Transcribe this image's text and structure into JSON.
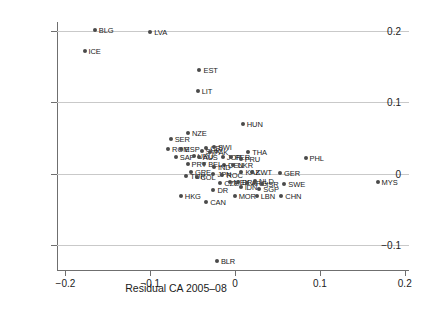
{
  "chart_data": {
    "type": "scatter",
    "title": "",
    "xlabel": "Residual CA 2005–08",
    "ylabel": "Change in CA balance, 2010 vs 2005–08",
    "xlim": [
      -0.21,
      0.205
    ],
    "ylim": [
      -0.135,
      0.212
    ],
    "xticks": [
      -0.2,
      -0.1,
      0,
      0.1,
      0.2
    ],
    "xticklabels": [
      "−0.2",
      "−0.1",
      "0",
      "0.1",
      "0.2"
    ],
    "yticks": [
      0.2,
      0.1,
      0,
      -0.1
    ],
    "yticklabels": [
      "0.2",
      "0.1",
      "0",
      "−0.1"
    ],
    "grid": "horizontal",
    "legend": "none",
    "marker_color": "#4a4a4a",
    "grid_color": "#c9c9c9",
    "axis_color": "#6f6f6f",
    "points": [
      {
        "label": "BLG",
        "x": -0.1655,
        "y": 0.2005
      },
      {
        "label": "LVA",
        "x": -0.1,
        "y": 0.1985
      },
      {
        "label": "ICE",
        "x": -0.1775,
        "y": 0.172
      },
      {
        "label": "EST",
        "x": -0.042,
        "y": 0.145
      },
      {
        "label": "LIT",
        "x": -0.044,
        "y": 0.1155
      },
      {
        "label": "HUN",
        "x": 0.009,
        "y": 0.069
      },
      {
        "label": "NZE",
        "x": -0.0555,
        "y": 0.0565
      },
      {
        "label": "SER",
        "x": -0.076,
        "y": 0.048
      },
      {
        "label": "ROM",
        "x": -0.079,
        "y": 0.0345
      },
      {
        "label": "ESP",
        "x": -0.064,
        "y": 0.0345
      },
      {
        "label": "CRI",
        "x": -0.034,
        "y": 0.036
      },
      {
        "label": "SWI",
        "x": -0.025,
        "y": 0.0375
      },
      {
        "label": "SVK",
        "x": -0.0395,
        "y": 0.031
      },
      {
        "label": "PAK",
        "x": -0.0295,
        "y": 0.0305
      },
      {
        "label": "THA",
        "x": 0.0155,
        "y": 0.0305
      },
      {
        "label": "SAF",
        "x": -0.07,
        "y": 0.0235
      },
      {
        "label": "URU",
        "x": -0.049,
        "y": 0.025
      },
      {
        "label": "AUS",
        "x": -0.043,
        "y": 0.023
      },
      {
        "label": "JOR",
        "x": -0.0145,
        "y": 0.0225
      },
      {
        "label": "PER",
        "x": -0.005,
        "y": 0.023
      },
      {
        "label": "PRU",
        "x": 0.0065,
        "y": 0.021
      },
      {
        "label": "PRT",
        "x": -0.056,
        "y": 0.014
      },
      {
        "label": "BEL",
        "x": -0.0365,
        "y": 0.014
      },
      {
        "label": "DEN",
        "x": -0.013,
        "y": 0.0125
      },
      {
        "label": "UKR",
        "x": -0.002,
        "y": 0.012
      },
      {
        "label": "IND",
        "x": -0.025,
        "y": 0.0095
      },
      {
        "label": "GRE",
        "x": -0.052,
        "y": 0.002
      },
      {
        "label": "TUR",
        "x": -0.0575,
        "y": -0.003
      },
      {
        "label": "COL",
        "x": -0.0455,
        "y": -0.0045
      },
      {
        "label": "JPN",
        "x": -0.0255,
        "y": -0.001
      },
      {
        "label": "ROC",
        "x": -0.015,
        "y": -0.002
      },
      {
        "label": "KAZ",
        "x": 0.0075,
        "y": 0.002
      },
      {
        "label": "KWT",
        "x": 0.0195,
        "y": 0.002
      },
      {
        "label": "GER",
        "x": 0.053,
        "y": 0.001
      },
      {
        "label": "PHL",
        "x": 0.083,
        "y": 0.0215
      },
      {
        "label": "CZE",
        "x": -0.0175,
        "y": -0.013
      },
      {
        "label": "MEX",
        "x": -0.0065,
        "y": -0.0125
      },
      {
        "label": "BRA",
        "x": 0.0035,
        "y": -0.0125
      },
      {
        "label": "ARG",
        "x": 0.014,
        "y": -0.013
      },
      {
        "label": "NLD",
        "x": 0.0235,
        "y": -0.011
      },
      {
        "label": "ISR",
        "x": 0.032,
        "y": -0.014
      },
      {
        "label": "SWE",
        "x": 0.058,
        "y": -0.015
      },
      {
        "label": "MYS",
        "x": 0.168,
        "y": -0.012
      },
      {
        "label": "DR",
        "x": -0.0255,
        "y": -0.0225
      },
      {
        "label": "IDN",
        "x": 0.0065,
        "y": -0.0195
      },
      {
        "label": "SGP",
        "x": 0.0285,
        "y": -0.021
      },
      {
        "label": "HKG",
        "x": -0.064,
        "y": -0.032
      },
      {
        "label": "CAN",
        "x": -0.034,
        "y": -0.04
      },
      {
        "label": "MOR",
        "x": -0.0005,
        "y": -0.032
      },
      {
        "label": "LBN",
        "x": 0.0255,
        "y": -0.032
      },
      {
        "label": "CHN",
        "x": 0.0545,
        "y": -0.032
      },
      {
        "label": "BLR",
        "x": -0.0215,
        "y": -0.122
      }
    ]
  }
}
